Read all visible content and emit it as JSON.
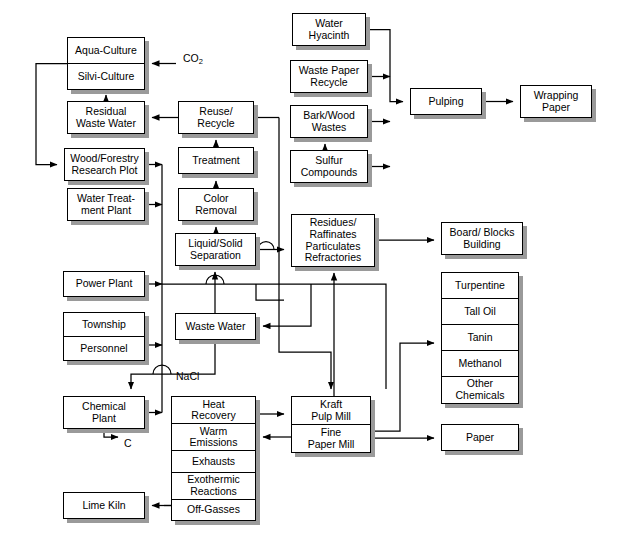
{
  "diagram": {
    "stroke_color": "#000000",
    "box_fill": "#ffffff",
    "shadow_color": "#9a9a9a",
    "background": "#ffffff"
  },
  "nodes": [
    {
      "id": "aqua_silvi",
      "rows": [
        "Aqua-Culture",
        "Silvi-Culture"
      ],
      "x": 67,
      "y": 37,
      "w": 78,
      "h": 53
    },
    {
      "id": "residual_waste_water",
      "rows": [
        "Residual\nWaste Water"
      ],
      "x": 67,
      "y": 101,
      "w": 78,
      "h": 33
    },
    {
      "id": "wood_forestry",
      "rows": [
        "Wood/Forestry\nResearch Plot"
      ],
      "x": 64,
      "y": 148,
      "w": 81,
      "h": 33
    },
    {
      "id": "water_treatment_plant",
      "rows": [
        "Water Treat-\nment Plant"
      ],
      "x": 67,
      "y": 188,
      "w": 78,
      "h": 33
    },
    {
      "id": "power_plant",
      "rows": [
        "Power Plant"
      ],
      "x": 63,
      "y": 271,
      "w": 82,
      "h": 26
    },
    {
      "id": "township_personnel",
      "rows": [
        "Township",
        "Personnel"
      ],
      "x": 63,
      "y": 312,
      "w": 82,
      "h": 49
    },
    {
      "id": "chemical_plant",
      "rows": [
        "Chemical\nPlant"
      ],
      "x": 63,
      "y": 396,
      "w": 82,
      "h": 33
    },
    {
      "id": "lime_kiln",
      "rows": [
        "Lime Kiln"
      ],
      "x": 63,
      "y": 492,
      "w": 82,
      "h": 27
    },
    {
      "id": "reuse_recycle",
      "rows": [
        "Reuse/\nRecycle"
      ],
      "x": 178,
      "y": 101,
      "w": 76,
      "h": 33
    },
    {
      "id": "treatment",
      "rows": [
        "Treatment"
      ],
      "x": 178,
      "y": 147,
      "w": 76,
      "h": 27
    },
    {
      "id": "color_removal",
      "rows": [
        "Color\nRemoval"
      ],
      "x": 178,
      "y": 188,
      "w": 76,
      "h": 33
    },
    {
      "id": "liquid_solid_separation",
      "rows": [
        "Liquid/Solid\nSeparation"
      ],
      "x": 175,
      "y": 233,
      "w": 81,
      "h": 33
    },
    {
      "id": "waste_water",
      "rows": [
        "Waste Water"
      ],
      "x": 175,
      "y": 313,
      "w": 81,
      "h": 27
    },
    {
      "id": "heat_recovery_stack",
      "rows": [
        "Heat\nRecovery",
        "Warm\nEmissions",
        "Exhausts",
        "Exothermic\nReactions",
        "Off-Gasses"
      ],
      "x": 171,
      "y": 396,
      "w": 85,
      "h": 125
    },
    {
      "id": "water_hyacinth",
      "rows": [
        "Water\nHyacinth"
      ],
      "x": 292,
      "y": 13,
      "w": 74,
      "h": 33
    },
    {
      "id": "waste_paper_recycle",
      "rows": [
        "Waste Paper\nRecycle"
      ],
      "x": 290,
      "y": 60,
      "w": 78,
      "h": 33
    },
    {
      "id": "bark_wood_wastes",
      "rows": [
        "Bark/Wood\nWastes"
      ],
      "x": 290,
      "y": 105,
      "w": 78,
      "h": 33
    },
    {
      "id": "sulfur_compounds",
      "rows": [
        "Sulfur\nCompounds"
      ],
      "x": 290,
      "y": 150,
      "w": 78,
      "h": 33
    },
    {
      "id": "residues_raffinates",
      "rows": [
        "Residues/\nRaffinates\nParticulates\nRefractories"
      ],
      "x": 291,
      "y": 214,
      "w": 84,
      "h": 53
    },
    {
      "id": "kraft_fine_mill",
      "rows": [
        "Kraft\nPulp Mill",
        "Fine\nPaper Mill"
      ],
      "x": 291,
      "y": 396,
      "w": 80,
      "h": 57
    },
    {
      "id": "pulping",
      "rows": [
        "Pulping"
      ],
      "x": 410,
      "y": 88,
      "w": 72,
      "h": 27
    },
    {
      "id": "wrapping_paper",
      "rows": [
        "Wrapping\nPaper"
      ],
      "x": 520,
      "y": 85,
      "w": 72,
      "h": 33
    },
    {
      "id": "board_blocks_building",
      "rows": [
        "Board/ Blocks\nBuilding"
      ],
      "x": 441,
      "y": 222,
      "w": 82,
      "h": 33
    },
    {
      "id": "chemicals_stack",
      "rows": [
        "Turpentine",
        "Tall Oil",
        "Tanin",
        "Methanol",
        "Other\nChemicals"
      ],
      "x": 441,
      "y": 272,
      "w": 78,
      "h": 132
    },
    {
      "id": "paper",
      "rows": [
        "Paper"
      ],
      "x": 441,
      "y": 424,
      "w": 78,
      "h": 27
    }
  ],
  "edge_labels": [
    {
      "id": "co2",
      "text": "CO",
      "sub": "2",
      "x": 183,
      "y": 52
    },
    {
      "id": "nacl",
      "text": "NaCl",
      "sub": "",
      "x": 176,
      "y": 370
    },
    {
      "id": "carbon",
      "text": "C",
      "sub": "",
      "x": 124,
      "y": 437
    }
  ]
}
